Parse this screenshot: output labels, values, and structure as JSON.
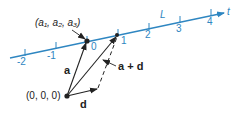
{
  "diagram": {
    "line": {
      "name": "L",
      "param_label": "t",
      "color": "#2e86c1",
      "ticks": [
        "-2",
        "-1",
        "0",
        "1",
        "2",
        "3",
        "4"
      ]
    },
    "points": {
      "base_point": "(a₁, a₂, a₃)",
      "origin": "(0, 0, 0)"
    },
    "vectors": {
      "a": "a",
      "d": "d",
      "sum": "a + d"
    }
  }
}
